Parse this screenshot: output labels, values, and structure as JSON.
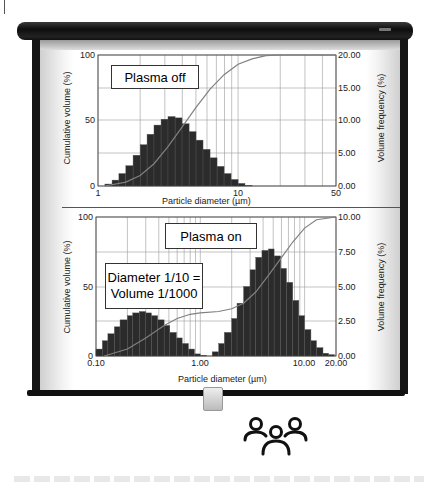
{
  "chart_data": [
    {
      "type": "bar",
      "title": "Plasma off",
      "xlabel": "Particle diameter (µm)",
      "ylabel_left": "Cumulative volume (%)",
      "ylabel_right": "Volume frequency (%)",
      "xscale": "log",
      "xlim": [
        1,
        50
      ],
      "ylim_left": [
        0,
        100
      ],
      "ylim_right": [
        0,
        20
      ],
      "x_ticks": [
        "1",
        "10",
        "50"
      ],
      "y_left_ticks": [
        "0",
        "50",
        "100"
      ],
      "y_right_ticks": [
        "0.00",
        "5.00",
        "10.00",
        "15.00",
        "20.00"
      ],
      "grid": true,
      "bin_edges_um": [
        1.12,
        1.26,
        1.41,
        1.58,
        1.78,
        2.0,
        2.24,
        2.51,
        2.82,
        3.16,
        3.55,
        3.98,
        4.47,
        5.01,
        5.62,
        6.31,
        7.08,
        7.94,
        8.91,
        10.0,
        11.2,
        12.6,
        14.1,
        15.8,
        17.8,
        20.0
      ],
      "series": [
        {
          "name": "Volume frequency (%)",
          "axis": "right",
          "values": [
            0.3,
            0.9,
            1.9,
            3.1,
            4.7,
            6.3,
            7.9,
            9.3,
            10.2,
            10.6,
            10.4,
            9.5,
            8.3,
            7.0,
            5.6,
            4.3,
            3.0,
            1.9,
            1.0,
            0.4,
            0.1
          ]
        },
        {
          "name": "Cumulative volume (%)",
          "axis": "left",
          "type": "line",
          "x": [
            1.12,
            1.58,
            2.0,
            2.51,
            3.16,
            3.98,
            5.01,
            6.31,
            7.94,
            10.0,
            12.6,
            15.8,
            20.0,
            50
          ],
          "values": [
            0,
            3,
            8,
            17,
            30,
            45,
            60,
            74,
            85,
            93,
            97,
            99.5,
            100,
            100
          ]
        }
      ],
      "annotations": [
        "Plasma off"
      ]
    },
    {
      "type": "bar",
      "title": "Plasma on",
      "xlabel": "Particle diameter (µm)",
      "ylabel_left": "Cumulative volume (%)",
      "ylabel_right": "Volume frequency (%)",
      "xscale": "log",
      "xlim": [
        0.1,
        20
      ],
      "ylim_left": [
        0,
        100
      ],
      "ylim_right": [
        0,
        10
      ],
      "x_ticks": [
        "0.10",
        "1.00",
        "10.00",
        "20.00"
      ],
      "y_left_ticks": [
        "0",
        "50",
        "100"
      ],
      "y_right_ticks": [
        "0.00",
        "2.50",
        "5.00",
        "7.50",
        "10.00"
      ],
      "grid": true,
      "series": [
        {
          "name": "Volume frequency (%) mode 1",
          "axis": "right",
          "x": [
            0.1,
            0.115,
            0.13,
            0.15,
            0.17,
            0.2,
            0.225,
            0.26,
            0.3,
            0.34,
            0.39,
            0.45,
            0.51,
            0.59,
            0.67,
            0.77,
            0.88,
            1.0,
            1.15
          ],
          "values": [
            0.5,
            1.1,
            1.6,
            2.1,
            2.6,
            2.9,
            3.1,
            3.2,
            3.1,
            2.9,
            2.6,
            2.2,
            1.7,
            1.3,
            0.9,
            0.5,
            0.15,
            0.05,
            0.0
          ]
        },
        {
          "name": "Volume frequency (%) mode 2",
          "axis": "right",
          "x": [
            1.3,
            1.5,
            1.7,
            2.0,
            2.25,
            2.6,
            3.0,
            3.4,
            3.9,
            4.5,
            5.1,
            5.9,
            6.7,
            7.7,
            8.8,
            10.0,
            11.5,
            13.0,
            15.0,
            17.0
          ],
          "values": [
            0.3,
            0.9,
            1.7,
            2.7,
            3.8,
            5.0,
            6.2,
            7.1,
            7.6,
            7.7,
            7.2,
            6.3,
            5.3,
            4.0,
            2.9,
            1.9,
            1.1,
            0.6,
            0.2,
            0.1
          ]
        },
        {
          "name": "Cumulative volume (%)",
          "axis": "left",
          "type": "line",
          "x": [
            0.12,
            0.2,
            0.3,
            0.45,
            0.6,
            0.8,
            1.0,
            1.5,
            2.0,
            2.6,
            3.4,
            4.5,
            5.9,
            7.7,
            10.0,
            13.0,
            20.0
          ],
          "values": [
            0,
            5,
            13,
            22,
            27,
            30,
            31,
            32,
            34,
            38,
            46,
            58,
            70,
            82,
            92,
            98,
            100
          ]
        }
      ],
      "annotations": [
        "Plasma on",
        "Diameter 1/10 =",
        "Volume 1/1000"
      ]
    }
  ],
  "charts": {
    "top": {
      "label": "Plasma off",
      "ylabel_left": "Cumulative volume (%)",
      "ylabel_right": "Volume frequency (%)",
      "xlabel": "Particle diameter (µm)",
      "x_ticks": [
        {
          "label": "1",
          "x": 98
        },
        {
          "label": "10",
          "x": 238
        },
        {
          "label": "50",
          "x": 336
        }
      ],
      "y_left_ticks": [
        {
          "label": "0",
          "y": 186
        },
        {
          "label": "50",
          "y": 120
        },
        {
          "label": "100",
          "y": 55
        }
      ],
      "y_right_ticks": [
        {
          "label": "0.00",
          "y": 186
        },
        {
          "label": "5.00",
          "y": 153
        },
        {
          "label": "10.00",
          "y": 120
        },
        {
          "label": "15.00",
          "y": 88
        },
        {
          "label": "20.00",
          "y": 55
        }
      ]
    },
    "bottom": {
      "label": "Plasma on",
      "note_line1": "Diameter 1/10 =",
      "note_line2": "Volume 1/1000",
      "ylabel_left": "Cumulative volume (%)",
      "ylabel_right": "Volume frequency (%)",
      "xlabel": "Particle diameter (µm)",
      "x_ticks": [
        {
          "label": "0.10",
          "x": 96
        },
        {
          "label": "1.00",
          "x": 200
        },
        {
          "label": "10.00",
          "x": 304
        },
        {
          "label": "20.00",
          "x": 336
        }
      ],
      "y_left_ticks": [
        {
          "label": "0",
          "y": 356
        },
        {
          "label": "50",
          "y": 287
        },
        {
          "label": "100",
          "y": 217
        }
      ],
      "y_right_ticks": [
        {
          "label": "0.00",
          "y": 356
        },
        {
          "label": "2.50",
          "y": 321
        },
        {
          "label": "5.00",
          "y": 287
        },
        {
          "label": "7.50",
          "y": 252
        },
        {
          "label": "10.00",
          "y": 217
        }
      ]
    }
  },
  "icons": {
    "people": "people-group-icon"
  },
  "colors": {
    "bar": "#2b2b2b",
    "curve": "#808080",
    "grid": "#9a9a9a",
    "frame": "#111111"
  }
}
